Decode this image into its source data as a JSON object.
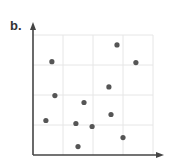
{
  "panel_label": "b.",
  "chart_data": {
    "type": "scatter",
    "title": "",
    "xlabel": "",
    "ylabel": "",
    "grid": true,
    "xlim": [
      0,
      4
    ],
    "ylim": [
      0,
      4
    ],
    "x_ticks": [],
    "y_ticks": [],
    "legend": [],
    "points": [
      {
        "x": 0.63,
        "y": 3.11
      },
      {
        "x": 2.8,
        "y": 3.67
      },
      {
        "x": 3.43,
        "y": 3.08
      },
      {
        "x": 2.53,
        "y": 2.27
      },
      {
        "x": 0.73,
        "y": 1.98
      },
      {
        "x": 1.7,
        "y": 1.75
      },
      {
        "x": 0.43,
        "y": 1.15
      },
      {
        "x": 2.6,
        "y": 1.35
      },
      {
        "x": 1.43,
        "y": 1.05
      },
      {
        "x": 1.97,
        "y": 0.95
      },
      {
        "x": 3.0,
        "y": 0.58
      },
      {
        "x": 1.5,
        "y": 0.28
      }
    ],
    "colors": {
      "point": "#555555",
      "grid": "#e6e6e6",
      "axis": "#444444"
    }
  }
}
